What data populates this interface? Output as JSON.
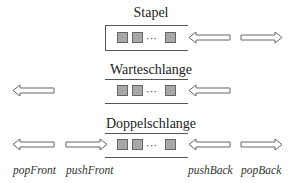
{
  "diagram": {
    "colors": {
      "element_fill": "#a8a8a8",
      "element_border": "#666666",
      "line": "#555555",
      "arrow_stroke": "#666666"
    },
    "sections": [
      {
        "id": "stack",
        "title": "Stapel",
        "elements": [
          "element",
          "element",
          "...",
          "element"
        ]
      },
      {
        "id": "queue",
        "title": "Warteschlange",
        "elements": [
          "element",
          "element",
          "...",
          "element"
        ]
      },
      {
        "id": "deque",
        "title": "Doppelschlange",
        "elements": [
          "element",
          "element",
          "...",
          "element"
        ]
      }
    ],
    "ellipsis": "···",
    "operation_labels": {
      "pop_front": "popFront",
      "push_front": "pushFront",
      "push_back": "pushBack",
      "pop_back": "popBack"
    }
  }
}
